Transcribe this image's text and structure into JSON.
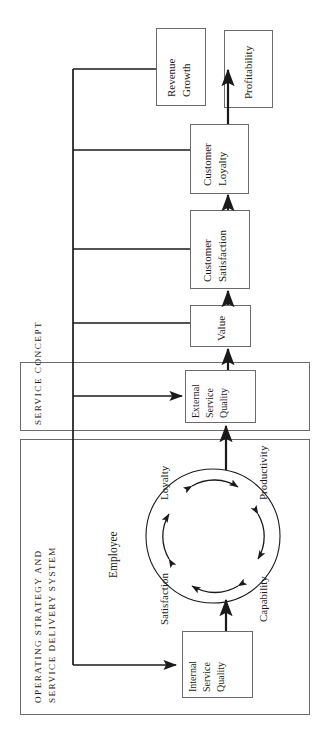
{
  "diagram": {
    "orientation": "rotated-90-ccw",
    "background": "#ffffff",
    "line_color": "#1a1a1a",
    "box_border": "#6b6b6b",
    "text_color": "#1a1a1a"
  },
  "groups": [
    {
      "id": "service-concept",
      "label": "Service Concept",
      "label_style": "small-caps"
    },
    {
      "id": "operating-strategy",
      "label_line1": "Operating Strategy and",
      "label_line2": "Service Delivery System",
      "label_style": "small-caps"
    }
  ],
  "boxes": [
    {
      "id": "revenue-growth",
      "lines": [
        "Revenue",
        "Growth"
      ]
    },
    {
      "id": "profitability",
      "lines": [
        "Profitability"
      ]
    },
    {
      "id": "customer-loyalty",
      "lines": [
        "Customer",
        "Loyalty"
      ]
    },
    {
      "id": "customer-satisfaction",
      "lines": [
        "Customer",
        "Satisfaction"
      ]
    },
    {
      "id": "value",
      "lines": [
        "Value"
      ]
    },
    {
      "id": "external-service-quality",
      "lines": [
        "External",
        "Service",
        "Quality"
      ]
    },
    {
      "id": "internal-service-quality",
      "lines": [
        "Internal",
        "Service",
        "Quality"
      ]
    }
  ],
  "employee_cycle": {
    "center_label": "Employee",
    "nodes": [
      "Loyalty",
      "Productivity",
      "Capability",
      "Satisfaction"
    ]
  }
}
